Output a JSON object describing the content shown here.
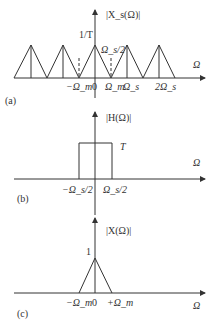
{
  "panels": [
    {
      "id": "a",
      "tag": "(a)",
      "ylabel": "|X_s(Ω)|",
      "xlabel": "Ω",
      "peak_label": "1/T",
      "cutoff_label": "Ω_s/2",
      "ticks": [
        "−Ω_m",
        "0",
        "Ω_m",
        "Ω_s",
        "2Ω_s"
      ]
    },
    {
      "id": "b",
      "tag": "(b)",
      "ylabel": "|H(Ω)|",
      "xlabel": "Ω",
      "level_label": "T",
      "ticks": [
        "−Ω_s/2",
        "Ω_s/2"
      ]
    },
    {
      "id": "c",
      "tag": "(c)",
      "ylabel": "|X(Ω)|",
      "xlabel": "Ω",
      "peak_label": "1",
      "ticks": [
        "−Ω_m",
        "0",
        "+Ω_m"
      ]
    }
  ],
  "colors": {
    "line": "#333333",
    "background": "#ffffff"
  }
}
